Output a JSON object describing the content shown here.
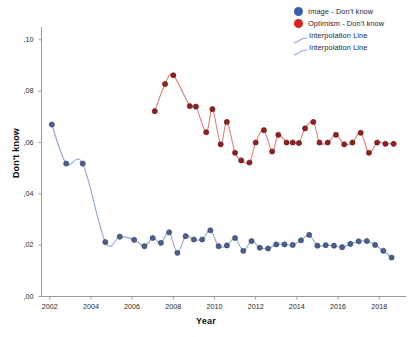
{
  "chart_data": {
    "type": "line",
    "title": "",
    "xlabel": "Year",
    "ylabel": "Don't know",
    "xlim": [
      2001.6,
      2019.3
    ],
    "ylim": [
      0.0,
      0.105
    ],
    "grid": false,
    "legend_position": "top-right",
    "x_ticks": [
      "2002",
      "2004",
      "2006",
      "2008",
      "2010",
      "2012",
      "2014",
      "2016",
      "2018"
    ],
    "x_tick_values": [
      2002,
      2004,
      2006,
      2008,
      2010,
      2012,
      2014,
      2016,
      2018
    ],
    "y_ticks": [
      ",00",
      ",02",
      ",04",
      ",06",
      ",08",
      ",10"
    ],
    "y_tick_values": [
      0.0,
      0.02,
      0.04,
      0.06,
      0.08,
      0.1
    ],
    "legend": [
      {
        "label": "Image - Don't know",
        "marker": "circle",
        "color": "#3a5fa8"
      },
      {
        "label": "Optimism - Don't know",
        "marker": "circle",
        "color": "#d52424"
      },
      {
        "label": "Interpolation Line",
        "marker": "line",
        "color": "#8fa6cc"
      },
      {
        "label": "Interpolation Line",
        "marker": "line",
        "color": "#8fa6cc"
      }
    ],
    "series": [
      {
        "name": "Image - Don't know",
        "marker_color": "#4a5f89",
        "line_color": "#8fa6cc",
        "x": [
          2002.1,
          2002.8,
          2003.6,
          2004.7,
          2005.4,
          2006.1,
          2006.6,
          2007.0,
          2007.4,
          2007.8,
          2008.2,
          2008.6,
          2009.0,
          2009.4,
          2009.8,
          2010.2,
          2010.6,
          2011.0,
          2011.4,
          2011.8,
          2012.2,
          2012.6,
          2013.0,
          2013.4,
          2013.8,
          2014.2,
          2014.6,
          2015.0,
          2015.4,
          2015.8,
          2016.2,
          2016.6,
          2017.0,
          2017.4,
          2017.8,
          2018.2,
          2018.6
        ],
        "y": [
          0.067,
          0.0518,
          0.0518,
          0.0212,
          0.0233,
          0.0221,
          0.0196,
          0.0228,
          0.0209,
          0.025,
          0.017,
          0.0235,
          0.0222,
          0.0222,
          0.0258,
          0.0196,
          0.0199,
          0.0228,
          0.0178,
          0.0216,
          0.019,
          0.0187,
          0.0203,
          0.0203,
          0.0201,
          0.0219,
          0.024,
          0.0198,
          0.02,
          0.0198,
          0.0192,
          0.0205,
          0.0215,
          0.0216,
          0.0201,
          0.0178,
          0.0152
        ]
      },
      {
        "name": "Optimism - Don't know",
        "marker_color": "#8b2322",
        "line_color": "#d98080",
        "x": [
          2007.1,
          2007.6,
          2008.0,
          2008.8,
          2009.1,
          2009.6,
          2009.9,
          2010.3,
          2010.6,
          2011.0,
          2011.3,
          2011.7,
          2012.0,
          2012.4,
          2012.8,
          2013.1,
          2013.5,
          2013.8,
          2014.1,
          2014.4,
          2014.8,
          2015.1,
          2015.5,
          2015.9,
          2016.3,
          2016.7,
          2017.1,
          2017.5,
          2017.9,
          2018.3,
          2018.7
        ],
        "y": [
          0.0722,
          0.0828,
          0.0862,
          0.0742,
          0.074,
          0.064,
          0.073,
          0.0593,
          0.068,
          0.056,
          0.053,
          0.0522,
          0.06,
          0.0648,
          0.0565,
          0.063,
          0.06,
          0.06,
          0.0598,
          0.0655,
          0.068,
          0.06,
          0.06,
          0.063,
          0.0593,
          0.06,
          0.0638,
          0.056,
          0.06,
          0.0595,
          0.0595
        ]
      }
    ]
  }
}
